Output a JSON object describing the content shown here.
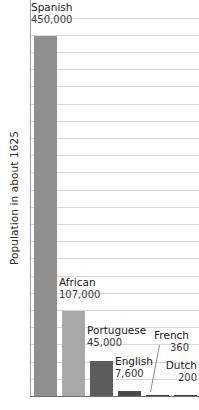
{
  "chart_data": {
    "type": "bar",
    "title": "",
    "subtitle": "",
    "xlabel": "",
    "ylabel": "Population in about 1625",
    "categories": [
      "Spanish",
      "African",
      "Portuguese",
      "English",
      "French",
      "Dutch"
    ],
    "values": [
      450000,
      107000,
      45000,
      7600,
      360,
      200
    ],
    "value_labels": [
      "450,000",
      "107,000",
      "45,000",
      "7,600",
      "360",
      "200"
    ],
    "ylim": [
      0,
      500000
    ],
    "grid": true,
    "gridlines": 22,
    "legend": "none",
    "orientation": "vertical",
    "bar_colors": [
      "#8f8f8f",
      "#a8a8a8",
      "#5c5c5c",
      "#4a4a4a",
      "#3f3f3f",
      "#3f3f3f"
    ]
  },
  "axis": {
    "y_title": "Population in about 1625"
  },
  "bars": [
    {
      "name": "Spanish",
      "value_label": "450,000",
      "color": "#8f8f8f"
    },
    {
      "name": "African",
      "value_label": "107,000",
      "color": "#a8a8a8"
    },
    {
      "name": "Portuguese",
      "value_label": "45,000",
      "color": "#5c5c5c"
    },
    {
      "name": "English",
      "value_label": "7,600",
      "color": "#4a4a4a"
    },
    {
      "name": "French",
      "value_label": "360",
      "color": "#3f3f3f"
    },
    {
      "name": "Dutch",
      "value_label": "200",
      "color": "#3f3f3f"
    }
  ],
  "colors": {
    "gridline": "#d8d8d8",
    "axis": "#6e6e6e",
    "background": "#ffffff",
    "text": "#1a1a1a"
  }
}
